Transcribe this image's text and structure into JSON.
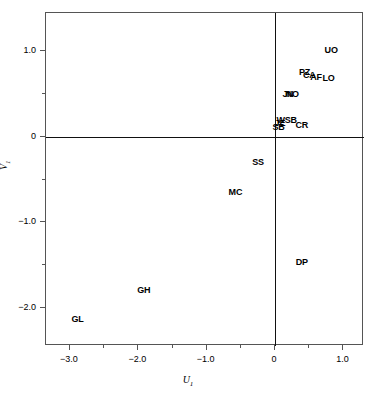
{
  "chart_data": {
    "type": "scatter",
    "title": "",
    "subtitle": "",
    "xlabel": "U",
    "xlabel_sub": "1",
    "ylabel": "V",
    "ylabel_sub": "1",
    "xlim": [
      -3.35,
      1.3
    ],
    "ylim": [
      -2.45,
      1.45
    ],
    "xticks": [
      -3.0,
      -2.0,
      -1.0,
      0,
      1.0
    ],
    "xticklabels": [
      "-3.0",
      "-2.0",
      "-1.0",
      "0",
      "1.0"
    ],
    "xticks_minor": [
      -2.5,
      -1.5,
      -0.5,
      0.5
    ],
    "yticks": [
      1.0,
      0,
      -1.0,
      -2.0
    ],
    "yticklabels": [
      "1.0",
      "0",
      "-1.0",
      "-2.0"
    ],
    "yticks_minor": [
      0.5,
      -0.5,
      -1.5
    ],
    "grid": false,
    "legend": "none",
    "marker_style": "text-label-only",
    "reference_lines": [
      {
        "axis": "vertical",
        "value": 0
      },
      {
        "axis": "horizontal",
        "value": 0
      }
    ],
    "points": [
      {
        "label": "UO",
        "x": 0.82,
        "y": 1.02
      },
      {
        "label": "PZ",
        "x": 0.43,
        "y": 0.76
      },
      {
        "label": "CA",
        "x": 0.5,
        "y": 0.72
      },
      {
        "label": "AF",
        "x": 0.6,
        "y": 0.7
      },
      {
        "label": "LO",
        "x": 0.78,
        "y": 0.69
      },
      {
        "label": "JN",
        "x": 0.19,
        "y": 0.5
      },
      {
        "label": "NO",
        "x": 0.25,
        "y": 0.5
      },
      {
        "label": "WSB",
        "x": 0.17,
        "y": 0.2
      },
      {
        "label": "JE",
        "x": 0.07,
        "y": 0.16
      },
      {
        "label": "SB",
        "x": 0.05,
        "y": 0.11
      },
      {
        "label": "CR",
        "x": 0.39,
        "y": 0.14
      },
      {
        "label": "SS",
        "x": -0.25,
        "y": -0.3
      },
      {
        "label": "MC",
        "x": -0.58,
        "y": -0.65
      },
      {
        "label": "DP",
        "x": 0.39,
        "y": -1.47
      },
      {
        "label": "GH",
        "x": -1.92,
        "y": -1.79
      },
      {
        "label": "GL",
        "x": -2.89,
        "y": -2.13
      }
    ]
  },
  "colors": {
    "background": "#ffffff",
    "frame": "#555555",
    "text": "#000000",
    "reference_line": "#111111"
  }
}
